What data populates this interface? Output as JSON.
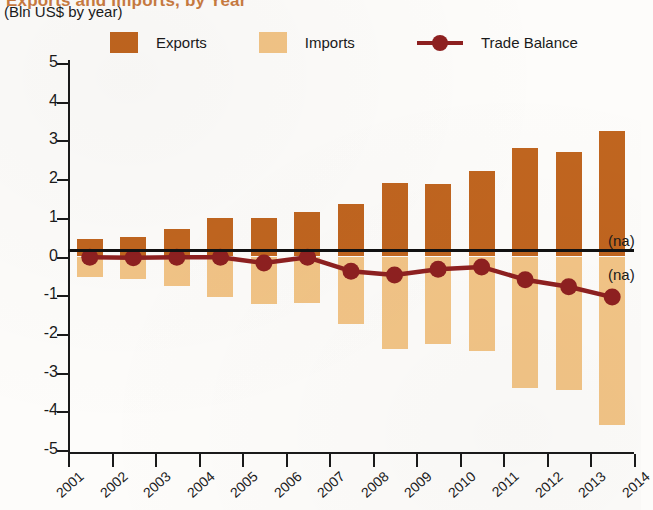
{
  "header": {
    "title_clipped": "Exports and Imports, by Year",
    "subtitle": "(Bln US$ by year)"
  },
  "legend": {
    "exports_label": "Exports",
    "imports_label": "Imports",
    "balance_label": "Trade Balance",
    "exports_color": "#C0651F",
    "imports_color": "#F2C486",
    "balance_color": "#8E2020"
  },
  "annotations": {
    "na_upper": "(na)",
    "na_lower": "(na)"
  },
  "axis": {
    "y_ticks": [
      "5",
      "4",
      "3",
      "2",
      "1",
      "0",
      "-1",
      "-2",
      "-3",
      "-4",
      "-5"
    ],
    "x_ticks": [
      "2001",
      "2002",
      "2003",
      "2004",
      "2005",
      "2006",
      "2007",
      "2008",
      "2009",
      "2010",
      "2011",
      "2012",
      "2013",
      "2014"
    ]
  },
  "chart_data": {
    "type": "bar",
    "title": "Exports and Imports, by Year",
    "subtitle": "(Bln US$ by year)",
    "xlabel": "",
    "ylabel": "Bln US$",
    "ylim": [
      -5,
      5
    ],
    "xlim_labels": [
      "2001",
      "2014"
    ],
    "grid": false,
    "legend_position": "top",
    "categories": [
      "2001",
      "2002",
      "2003",
      "2004",
      "2005",
      "2006",
      "2007",
      "2008",
      "2009",
      "2010",
      "2011",
      "2012",
      "2013"
    ],
    "series": [
      {
        "name": "Exports",
        "type": "bar",
        "color": "#C0651F",
        "values": [
          0.45,
          0.5,
          0.7,
          1.0,
          1.0,
          1.15,
          1.35,
          1.9,
          1.88,
          2.2,
          2.8,
          2.7,
          3.25
        ]
      },
      {
        "name": "Imports",
        "type": "bar",
        "color": "#F2C486",
        "values": [
          -0.53,
          -0.58,
          -0.75,
          -1.05,
          -1.22,
          -1.2,
          -1.75,
          -2.4,
          -2.25,
          -2.45,
          -3.4,
          -3.45,
          -4.35
        ]
      },
      {
        "name": "Trade Balance",
        "type": "line",
        "color": "#8E2020",
        "values": [
          -0.02,
          -0.03,
          -0.02,
          -0.02,
          -0.17,
          -0.02,
          -0.38,
          -0.48,
          -0.33,
          -0.27,
          -0.6,
          -0.78,
          -1.05
        ]
      }
    ],
    "notes": [
      "(na)",
      "(na)"
    ]
  }
}
